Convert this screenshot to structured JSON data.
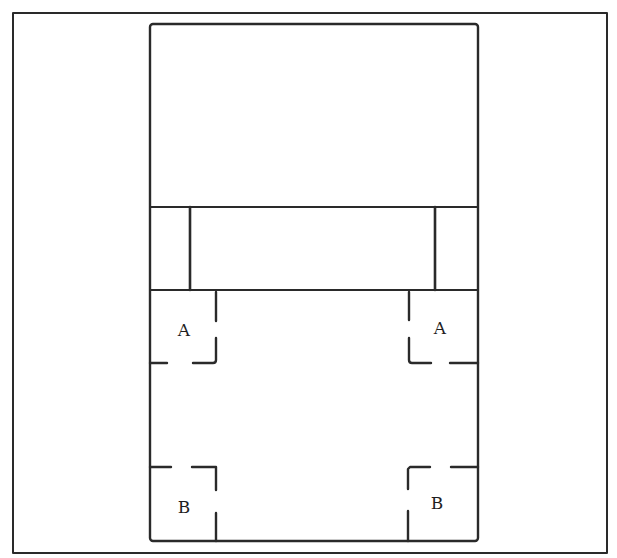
{
  "diagram": {
    "type": "floor-plan-layout",
    "stroke_color": "#2a2a2a",
    "background": "#ffffff",
    "outer_frame": {
      "x1": 13,
      "y1": 13,
      "x2": 607,
      "y2": 553
    },
    "main_rect": {
      "x1": 150,
      "y1": 24,
      "x2": 478,
      "y2": 541
    },
    "top_section": {
      "y1": 24,
      "y2": 207
    },
    "middle_band": {
      "y1": 207,
      "y2": 290,
      "left_divider_x": 190,
      "right_divider_x": 435
    },
    "bottom_section": {
      "y1": 290,
      "y2": 541
    },
    "labels": [
      {
        "id": "top-left-A",
        "text": "A",
        "x": 184,
        "y": 330
      },
      {
        "id": "top-right-A",
        "text": "A",
        "x": 440,
        "y": 328
      },
      {
        "id": "bottom-left-B",
        "text": "B",
        "x": 184,
        "y": 507
      },
      {
        "id": "bottom-right-B",
        "text": "B",
        "x": 437,
        "y": 503
      }
    ]
  }
}
